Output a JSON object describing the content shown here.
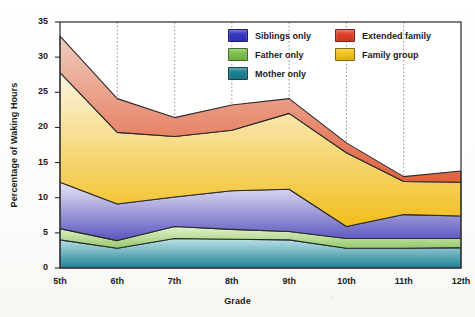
{
  "chart_data": {
    "type": "area",
    "stacked": true,
    "title": "",
    "xlabel": "Grade",
    "ylabel": "Percentage of Waking Hours",
    "categories": [
      "5th",
      "6th",
      "7th",
      "8th",
      "9th",
      "10th",
      "11th",
      "12th"
    ],
    "x": [
      0,
      1,
      2,
      3,
      4,
      5,
      6,
      7
    ],
    "ylim": [
      0,
      35
    ],
    "yticks": [
      0,
      5,
      10,
      15,
      20,
      25,
      30,
      35
    ],
    "ytick_labels": [
      "0",
      "5",
      "10",
      "15",
      "20",
      "25",
      "30",
      "35"
    ],
    "grid": "vertical-dotted",
    "legend_position": "top-right-inside",
    "series": [
      {
        "name": "Mother only",
        "color": "#1b8195",
        "values": [
          4.0,
          2.8,
          4.2,
          4.1,
          4.0,
          2.8,
          2.8,
          2.9
        ]
      },
      {
        "name": "Father only",
        "color": "#7cc24a",
        "values": [
          1.6,
          1.1,
          1.7,
          1.4,
          1.2,
          1.4,
          1.4,
          1.3
        ]
      },
      {
        "name": "Siblings only",
        "color": "#3535c4",
        "values": [
          6.6,
          5.2,
          4.2,
          5.5,
          6.0,
          0.0,
          3.4,
          3.2
        ]
      },
      {
        "name": "Family group",
        "color": "#f5c518",
        "values": [
          15.6,
          10.2,
          8.6,
          8.6,
          10.8,
          10.5,
          4.7,
          4.8
        ]
      },
      {
        "name": "Extended family",
        "color": "#e04028",
        "values": [
          5.2,
          4.8,
          2.7,
          3.6,
          2.1,
          1.4,
          0.7,
          1.6
        ]
      }
    ],
    "cumulative_tops": {
      "Mother only": [
        4.0,
        2.8,
        4.2,
        4.1,
        4.0,
        2.8,
        2.8,
        2.9
      ],
      "Father only": [
        5.6,
        3.9,
        5.9,
        5.5,
        5.2,
        4.2,
        4.2,
        4.2
      ],
      "Siblings only": [
        12.2,
        9.1,
        10.1,
        11.0,
        11.2,
        5.9,
        7.6,
        7.4
      ],
      "Family group": [
        27.8,
        19.3,
        18.7,
        19.6,
        22.0,
        16.4,
        12.3,
        12.2
      ],
      "Extended family": [
        33.0,
        24.1,
        21.4,
        23.2,
        24.1,
        17.8,
        13.0,
        13.8
      ]
    },
    "legend_entries": [
      {
        "label": "Siblings only",
        "color": "#3535c4"
      },
      {
        "label": "Extended family",
        "color": "#e04028"
      },
      {
        "label": "Father only",
        "color": "#7cc24a"
      },
      {
        "label": "Family group",
        "color": "#f5c518"
      },
      {
        "label": "Mother only",
        "color": "#1b8195"
      }
    ]
  },
  "axes": {
    "y_title": "Percentage of Waking Hours",
    "x_title": "Grade"
  }
}
